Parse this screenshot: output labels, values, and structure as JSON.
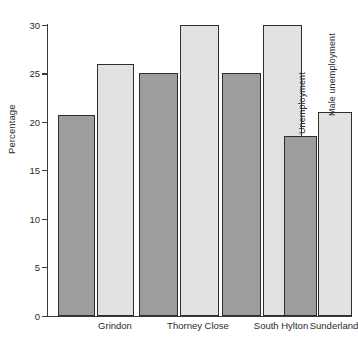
{
  "chart_data": {
    "type": "bar",
    "title": "",
    "subtitle": "",
    "xlabel": "",
    "ylabel": "Percentage",
    "categories": [
      "Grindon",
      "Thorney Close",
      "South Hylton",
      "Sunderland"
    ],
    "series": [
      {
        "name": "Unemployment",
        "values": [
          20.7,
          25.0,
          25.0,
          18.5
        ],
        "color": "#9d9d9d"
      },
      {
        "name": "Male unemployment",
        "values": [
          26.0,
          30.0,
          30.0,
          21.0
        ],
        "color": "#e2e2e2"
      }
    ],
    "ylim": [
      0,
      30
    ],
    "ytick_labels": [
      "30",
      "25",
      "20",
      "15",
      "10",
      "5",
      "0"
    ],
    "ytick_values": [
      30,
      25,
      20,
      15,
      10,
      5,
      0
    ],
    "grid": false,
    "legend": "inline-rotated-labels-on-last-group",
    "legend_position": "inside-plot-over-sunderland-bars",
    "annotations": [
      {
        "text": "Unemployment",
        "rotation": -90,
        "target": "Sunderland dark bar"
      },
      {
        "text": "Male unemployment",
        "rotation": -90,
        "target": "Sunderland light bar"
      }
    ]
  },
  "axis": {
    "y_label": "Percentage",
    "ticks": [
      {
        "label": "30",
        "value": 30
      },
      {
        "label": "25",
        "value": 25
      },
      {
        "label": "20",
        "value": 20
      },
      {
        "label": "15",
        "value": 15
      },
      {
        "label": "10",
        "value": 10
      },
      {
        "label": "5",
        "value": 5
      },
      {
        "label": "0",
        "value": 0
      }
    ]
  },
  "categories": [
    {
      "label": "Grindon"
    },
    {
      "label": "Thorney Close"
    },
    {
      "label": "South Hylton"
    },
    {
      "label": "Sunderland"
    }
  ],
  "series_labels": {
    "unemployment": "Unemployment",
    "male_unemployment": "Male unemployment"
  }
}
